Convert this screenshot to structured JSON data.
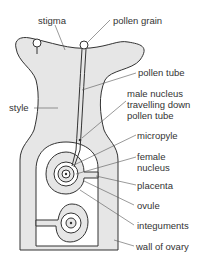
{
  "diagram": {
    "colors": {
      "fill": "#e6e6e6",
      "outline": "#333333",
      "leader": "#555555",
      "text": "#333333"
    },
    "labels": {
      "stigma": "stigma",
      "pollen_grain": "pollen grain",
      "pollen_tube": "pollen tube",
      "style": "style",
      "male_nucleus_1": "male nucleus",
      "male_nucleus_2": "travelling down",
      "male_nucleus_3": "pollen tube",
      "micropyle": "micropyle",
      "female_nucleus_1": "female",
      "female_nucleus_2": "nucleus",
      "placenta": "placenta",
      "ovule": "ovule",
      "integuments": "integuments",
      "wall_of_ovary": "wall of ovary"
    }
  }
}
